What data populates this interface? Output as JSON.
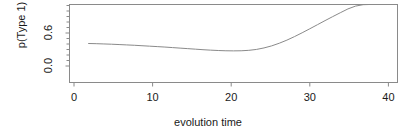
{
  "chart_data": {
    "type": "line",
    "title": "",
    "xlabel": "evolution time",
    "ylabel": "p(Type 1)",
    "xlim": [
      -1.5,
      41.5
    ],
    "ylim": [
      0.0,
      0.88
    ],
    "xticks": [
      0,
      10,
      20,
      30,
      40
    ],
    "xtick_labels": [
      "0",
      "10",
      "20",
      "30",
      "40"
    ],
    "yticks": [
      0.0,
      0.6
    ],
    "ytick_labels": [
      "0.0",
      "0.6"
    ],
    "grid": false,
    "legend": false,
    "line_color": "#8a8a8a",
    "box_color": "#8a8a8a",
    "series": [
      {
        "name": "p(Type 1)",
        "x": [
          1,
          2,
          3,
          4,
          5,
          6,
          7,
          8,
          9,
          10,
          11,
          12,
          13,
          14,
          15,
          16,
          17,
          18,
          19,
          20,
          21,
          22,
          23,
          24,
          25,
          26,
          27,
          28,
          29,
          30,
          31,
          32,
          33,
          34,
          35,
          36,
          37,
          37.8
        ],
        "values": [
          0.44,
          0.438,
          0.435,
          0.432,
          0.428,
          0.424,
          0.42,
          0.415,
          0.41,
          0.405,
          0.4,
          0.394,
          0.388,
          0.382,
          0.376,
          0.37,
          0.365,
          0.361,
          0.358,
          0.357,
          0.358,
          0.363,
          0.373,
          0.39,
          0.413,
          0.443,
          0.478,
          0.518,
          0.561,
          0.606,
          0.652,
          0.698,
          0.743,
          0.787,
          0.83,
          0.862,
          0.878,
          0.88
        ]
      }
    ]
  },
  "axis": {
    "xtick_0": "0",
    "xtick_1": "10",
    "xtick_2": "20",
    "xtick_3": "30",
    "xtick_4": "40",
    "ytick_0": "0.0",
    "ytick_1": "0.6",
    "xlabel": "evolution time",
    "ylabel": "p(Type 1)"
  }
}
